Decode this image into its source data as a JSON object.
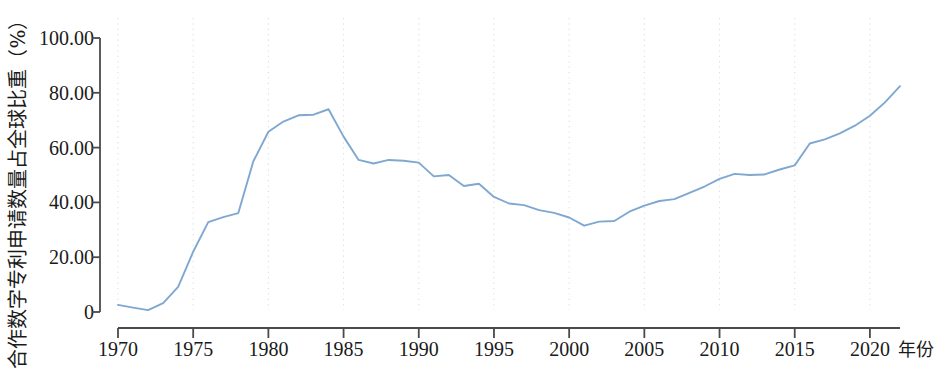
{
  "chart_data": {
    "type": "line",
    "title": "",
    "subtitle": "",
    "xlabel": "年份",
    "ylabel": "合作数字专利申请数量占全球比重（%）",
    "xlim": [
      1970,
      2022
    ],
    "ylim": [
      0,
      100
    ],
    "grid": "vertical-dotted",
    "legend": "none",
    "line_color": "#7FA8D1",
    "x_ticks": [
      1970,
      1975,
      1980,
      1985,
      1990,
      1995,
      2000,
      2005,
      2010,
      2015,
      2020
    ],
    "x_tick_labels": [
      "1970",
      "1975",
      "1980",
      "1985",
      "1990",
      "1995",
      "2000",
      "2005",
      "2010",
      "2015",
      "2020"
    ],
    "y_ticks": [
      0,
      20,
      40,
      60,
      80,
      100
    ],
    "y_tick_labels": [
      "0",
      "20.00",
      "40.00",
      "60.00",
      "80.00",
      "100.00"
    ],
    "series": [
      {
        "name": "合作数字专利申请数量占全球比重",
        "x": [
          1970,
          1971,
          1972,
          1973,
          1974,
          1975,
          1976,
          1977,
          1978,
          1979,
          1980,
          1981,
          1982,
          1983,
          1984,
          1985,
          1986,
          1987,
          1988,
          1989,
          1990,
          1991,
          1992,
          1993,
          1994,
          1995,
          1996,
          1997,
          1998,
          1999,
          2000,
          2001,
          2002,
          2003,
          2004,
          2005,
          2006,
          2007,
          2008,
          2009,
          2010,
          2011,
          2012,
          2013,
          2014,
          2015,
          2016,
          2017,
          2018,
          2019,
          2020,
          2021,
          2022
        ],
        "values": [
          2.6,
          1.6,
          0.7,
          3.2,
          9.2,
          22.0,
          32.8,
          34.6,
          36.1,
          55.0,
          65.8,
          69.5,
          71.8,
          72.0,
          74.0,
          64.0,
          55.5,
          54.2,
          55.5,
          55.2,
          54.5,
          49.5,
          50.0,
          46.0,
          46.8,
          42.0,
          39.6,
          39.0,
          37.2,
          36.2,
          34.5,
          31.5,
          33.0,
          33.2,
          36.6,
          38.8,
          40.5,
          41.2,
          43.5,
          45.8,
          48.6,
          50.4,
          50.0,
          50.2,
          52.0,
          53.5,
          61.5,
          63.0,
          65.2,
          68.0,
          71.6,
          76.5,
          82.4
        ]
      }
    ]
  },
  "axes": {
    "y_title": "合作数字专利申请数量占全球比重（%）",
    "x_title": "年份"
  }
}
